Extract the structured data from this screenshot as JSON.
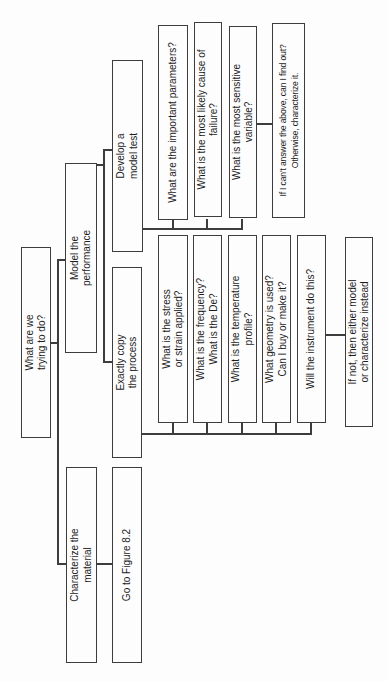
{
  "figure": {
    "colors": {
      "ink": "#1c1c1c",
      "line": "#3d3d3d",
      "paper": "#fdfdfd"
    },
    "nodes": {
      "root": {
        "label": "What are we\ntrying to do?"
      },
      "characterize": {
        "label": "Characterize the\nmaterial"
      },
      "model_performance": {
        "label": "Model the\nperformance"
      },
      "goto_figure": {
        "label": "Go to Figure 8.2"
      },
      "exactly_copy": {
        "label": "Exactly copy\nthe process"
      },
      "develop_test": {
        "label": "Develop a\nmodel test"
      },
      "stress": {
        "label": "What is the stress\nor strain applied?"
      },
      "frequency": {
        "label": "What is the frequency?\nWhat is the De?"
      },
      "temperature": {
        "label": "What is the temperature\nprofile?"
      },
      "geometry": {
        "label": "What geometry is used?\nCan I buy or make it?"
      },
      "instrument": {
        "label": "Will the instrument do this?"
      },
      "if_not": {
        "label": "If not, then either model\nor characterize instead"
      },
      "parameters": {
        "label": "What are the important parameters?"
      },
      "failure": {
        "label": "What is the most likely cause of\nfailure?"
      },
      "sensitive": {
        "label": "What is the most sensitive\nvariable?"
      },
      "cant_answer": {
        "label": "If I can't answer the above, can I find out?\nOtherwise, characterize it."
      }
    }
  }
}
